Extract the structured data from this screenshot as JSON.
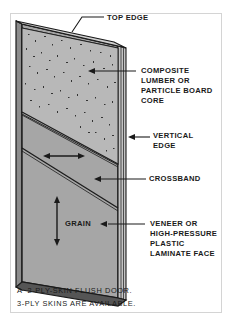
{
  "figure": {
    "labels": {
      "top_edge": "TOP EDGE",
      "core": [
        "COMPOSITE",
        "LUMBER OR",
        "PARTICLE BOARD",
        "CORE"
      ],
      "vertical_edge": [
        "VERTICAL",
        "EDGE"
      ],
      "crossband": "CROSSBAND",
      "grain": "GRAIN",
      "face": [
        "VENEER OR",
        "HIGH-PRESSURE",
        "PLASTIC",
        "LAMINATE FACE"
      ]
    },
    "caption": {
      "line1": "A  2-PLY-SKIN FLUSH DOOR.",
      "line2": "3-PLY SKINS ARE AVAILABLE."
    },
    "colors": {
      "line": "#1a1a1a",
      "core_fill": "#b8b8b8",
      "crossband_fill": "#a9a9a9",
      "face_fill": "#a6a6a6",
      "edge_fill": "#c4c4c4",
      "frame_border": "#d4d4d4"
    }
  }
}
